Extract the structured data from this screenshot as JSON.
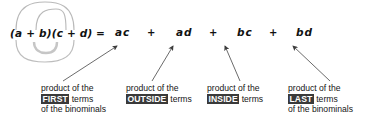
{
  "equation": {
    "expression": "(a + b)(c + d)",
    "equals": "=",
    "terms": [
      "ac",
      "ad",
      "bc",
      "bd"
    ],
    "operators": [
      "+",
      "+",
      "+"
    ]
  },
  "captions": [
    {
      "line1": "product of the",
      "highlight": "FIRST",
      "after": " terms",
      "line3": "of the binominals"
    },
    {
      "line1": "product of the",
      "highlight": "OUTSIDE",
      "after": " terms",
      "line3": ""
    },
    {
      "line1": "product of the",
      "highlight": "INSIDE",
      "after": " terms",
      "line3": ""
    },
    {
      "line1": "product of the",
      "highlight": "LAST",
      "after": " terms",
      "line3": "of the binominals"
    }
  ],
  "colors": {
    "text": "#151515",
    "highlight_bg": "#3a3a3a",
    "highlight_fg": "#ffffff",
    "arc": "#b4b4b4",
    "arrow": "#555555",
    "background": "#ffffff"
  }
}
